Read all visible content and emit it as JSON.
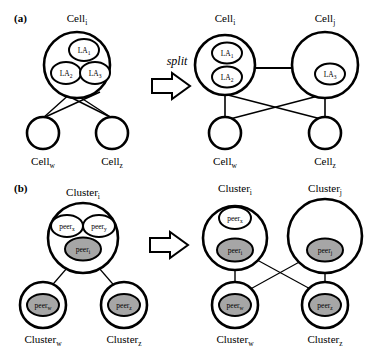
{
  "figure": {
    "panels": [
      {
        "tag": "(a)",
        "id": "panel-a",
        "description": "Cell split with learning automata",
        "arrow_label": "split",
        "before": {
          "parent": {
            "label": "Cell",
            "sub": "i"
          },
          "inner": [
            {
              "label": "LA",
              "sub": "1",
              "fill": "white"
            },
            {
              "label": "LA",
              "sub": "2",
              "fill": "white"
            },
            {
              "label": "LA",
              "sub": "3",
              "fill": "white"
            }
          ],
          "children": [
            {
              "label": "Cell",
              "sub": "w"
            },
            {
              "label": "Cell",
              "sub": "z"
            }
          ]
        },
        "after": {
          "parents": [
            {
              "label": "Cell",
              "sub": "i"
            },
            {
              "label": "Cell",
              "sub": "j"
            }
          ],
          "inner_left": [
            {
              "label": "LA",
              "sub": "1",
              "fill": "white"
            },
            {
              "label": "LA",
              "sub": "2",
              "fill": "white"
            }
          ],
          "inner_right": [
            {
              "label": "LA",
              "sub": "3",
              "fill": "white"
            }
          ],
          "children": [
            {
              "label": "Cell",
              "sub": "w"
            },
            {
              "label": "Cell",
              "sub": "z"
            }
          ]
        }
      },
      {
        "tag": "(b)",
        "id": "panel-b",
        "description": "Cluster split with peers",
        "arrow_label": "",
        "before": {
          "parent": {
            "label": "Cluster",
            "sub": "i"
          },
          "inner": [
            {
              "label": "peer",
              "sub": "x",
              "fill": "white"
            },
            {
              "label": "peer",
              "sub": "y",
              "fill": "white"
            },
            {
              "label": "peer",
              "sub": "i",
              "fill": "gray"
            }
          ],
          "children": [
            {
              "label": "Cluster",
              "sub": "w",
              "peer": {
                "label": "peer",
                "sub": "w",
                "fill": "gray"
              }
            },
            {
              "label": "Cluster",
              "sub": "z",
              "peer": {
                "label": "peer",
                "sub": "z",
                "fill": "gray"
              }
            }
          ]
        },
        "after": {
          "parents": [
            {
              "label": "Cluster",
              "sub": "i"
            },
            {
              "label": "Cluster",
              "sub": "j"
            }
          ],
          "inner_left": [
            {
              "label": "peer",
              "sub": "x",
              "fill": "white"
            },
            {
              "label": "peer",
              "sub": "i",
              "fill": "gray"
            }
          ],
          "inner_right": [
            {
              "label": "peer",
              "sub": "j",
              "fill": "gray"
            }
          ],
          "children": [
            {
              "label": "Cluster",
              "sub": "w",
              "peer": {
                "label": "peer",
                "sub": "w",
                "fill": "gray"
              }
            },
            {
              "label": "Cluster",
              "sub": "z",
              "peer": {
                "label": "peer",
                "sub": "z",
                "fill": "gray"
              }
            }
          ]
        }
      }
    ],
    "colors": {
      "stroke": "#000000",
      "gray_fill": "#a6a6a6",
      "white_fill": "#ffffff",
      "background": "#ffffff"
    }
  }
}
